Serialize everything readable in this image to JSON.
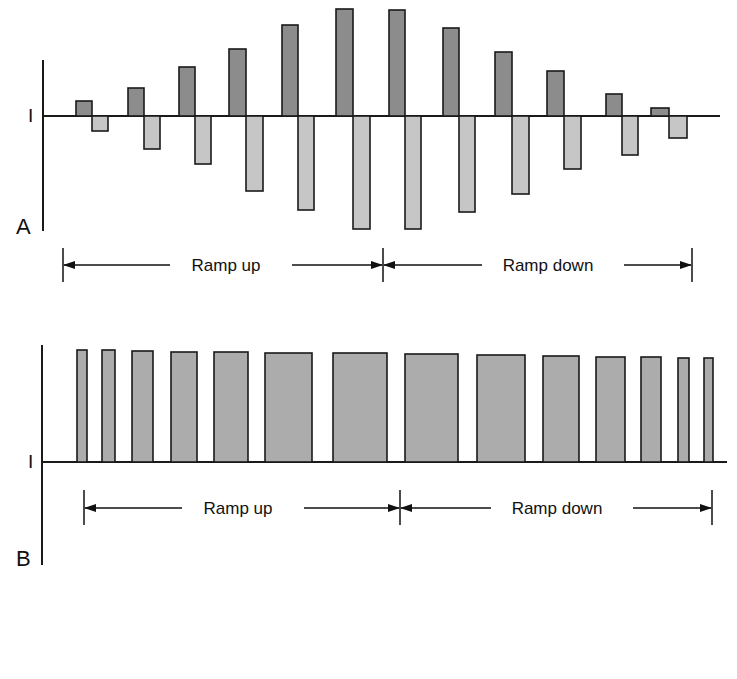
{
  "panels": [
    {
      "id": "A",
      "label": "A",
      "axis_label": "I",
      "type": "biphasic",
      "axis": {
        "x": 43,
        "y_top": 60,
        "y_bottom": 231,
        "baseline_y": 116,
        "baseline_x_end": 720
      },
      "colors": {
        "positive": "#8c8c8c",
        "negative": "#c6c6c6",
        "stroke": "#1a1a1a"
      },
      "pulses": [
        {
          "x": 76,
          "w": 16,
          "up_top": 101,
          "down_bottom": 131
        },
        {
          "x": 128,
          "w": 16,
          "up_top": 88,
          "down_bottom": 149
        },
        {
          "x": 179,
          "w": 16,
          "up_top": 67,
          "down_bottom": 164
        },
        {
          "x": 229,
          "w": 17,
          "up_top": 49,
          "down_bottom": 191
        },
        {
          "x": 282,
          "w": 16,
          "up_top": 25,
          "down_bottom": 210
        },
        {
          "x": 336,
          "w": 17,
          "up_top": 9,
          "down_bottom": 229
        },
        {
          "x": 389,
          "w": 16,
          "up_top": 10,
          "down_bottom": 229
        },
        {
          "x": 443,
          "w": 16,
          "up_top": 28,
          "down_bottom": 212
        },
        {
          "x": 495,
          "w": 17,
          "up_top": 52,
          "down_bottom": 194
        },
        {
          "x": 547,
          "w": 17,
          "up_top": 71,
          "down_bottom": 169
        },
        {
          "x": 606,
          "w": 16,
          "up_top": 94,
          "down_bottom": 155
        },
        {
          "x": 651,
          "w": 18,
          "up_top": 108,
          "down_bottom": 138
        }
      ],
      "ranges": {
        "y": 265,
        "tick_top": 248,
        "tick_bottom": 282,
        "left_x": 63,
        "mid_x": 383,
        "right_x": 692,
        "ramp_up_label": "Ramp up",
        "ramp_down_label": "Ramp down",
        "ramp_up_text_x": 226,
        "ramp_down_text_x": 548
      }
    },
    {
      "id": "B",
      "label": "B",
      "axis_label": "I",
      "type": "monophasic",
      "axis": {
        "x": 42,
        "y_top": 345,
        "y_bottom": 565,
        "baseline_y": 462,
        "baseline_x_end": 727
      },
      "colors": {
        "fill": "#acacac",
        "stroke": "#1a1a1a"
      },
      "pulses": [
        {
          "x": 77,
          "w": 10,
          "top": 350
        },
        {
          "x": 102,
          "w": 13,
          "top": 350
        },
        {
          "x": 132,
          "w": 21,
          "top": 351
        },
        {
          "x": 171,
          "w": 26,
          "top": 352
        },
        {
          "x": 214,
          "w": 34,
          "top": 352
        },
        {
          "x": 265,
          "w": 47,
          "top": 353
        },
        {
          "x": 333,
          "w": 54,
          "top": 353
        },
        {
          "x": 405,
          "w": 53,
          "top": 354
        },
        {
          "x": 477,
          "w": 48,
          "top": 355
        },
        {
          "x": 543,
          "w": 36,
          "top": 356
        },
        {
          "x": 596,
          "w": 29,
          "top": 357
        },
        {
          "x": 641,
          "w": 20,
          "top": 357
        },
        {
          "x": 678,
          "w": 11,
          "top": 358
        },
        {
          "x": 704,
          "w": 9,
          "top": 358
        }
      ],
      "ranges": {
        "y": 508,
        "tick_top": 490,
        "tick_bottom": 525,
        "left_x": 84,
        "mid_x": 400,
        "right_x": 712,
        "ramp_up_label": "Ramp up",
        "ramp_down_label": "Ramp down",
        "ramp_up_text_x": 238,
        "ramp_down_text_x": 557
      }
    }
  ]
}
